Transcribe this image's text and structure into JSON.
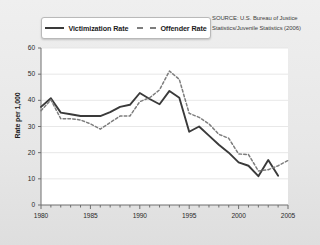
{
  "source_note": "SOURCE: U.S. Bureau of Justice Statistics/Juvenile Statistics (2006)",
  "legend": {
    "items": [
      {
        "label": "Victimization Rate",
        "style": "solid",
        "color": "#3a3a3a",
        "icon": "solid-line-swatch"
      },
      {
        "label": "Offender Rate",
        "style": "dashed",
        "color": "#7d7d7d",
        "icon": "dashed-line-swatch"
      }
    ]
  },
  "chart_data": {
    "type": "line",
    "title": "",
    "xlabel": "",
    "ylabel": "Rate per 1,000",
    "xlim": [
      1980,
      2005
    ],
    "ylim": [
      0,
      60
    ],
    "xticks": [
      1980,
      1985,
      1990,
      1995,
      2000,
      2005
    ],
    "xtick_labels": [
      "1980",
      "1985",
      "1990",
      "1995",
      "2000",
      "2005"
    ],
    "yticks": [
      0,
      10,
      20,
      30,
      40,
      50,
      60
    ],
    "ytick_labels": [
      "0",
      "10",
      "20",
      "30",
      "40",
      "50",
      "60"
    ],
    "minor_xticks_interval": 1,
    "grid": "horizontal",
    "legend_position": "top-left-outside",
    "x": [
      1980,
      1981,
      1982,
      1983,
      1984,
      1985,
      1986,
      1987,
      1988,
      1989,
      1990,
      1991,
      1992,
      1993,
      1994,
      1995,
      1996,
      1997,
      1998,
      1999,
      2000,
      2001,
      2002,
      2003,
      2004,
      2005
    ],
    "series": [
      {
        "name": "Victimization Rate",
        "style": "solid",
        "color": "#3a3a3a",
        "values": [
          37.5,
          40.8,
          35.3,
          34.7,
          34.0,
          34.0,
          34.0,
          35.5,
          37.5,
          38.3,
          42.8,
          40.5,
          38.5,
          43.6,
          41.0,
          28.0,
          30.0,
          26.5,
          23.0,
          20.0,
          16.3,
          15.0,
          11.0,
          17.2,
          11.2,
          null
        ]
      },
      {
        "name": "Offender Rate",
        "style": "dashed",
        "color": "#7d7d7d",
        "values": [
          36.0,
          40.2,
          33.0,
          33.0,
          32.5,
          31.0,
          29.0,
          31.5,
          34.0,
          34.0,
          39.5,
          41.0,
          44.0,
          51.2,
          48.0,
          35.0,
          33.5,
          31.0,
          27.0,
          25.5,
          19.5,
          19.3,
          13.0,
          13.5,
          15.0,
          17.0
        ]
      }
    ]
  }
}
